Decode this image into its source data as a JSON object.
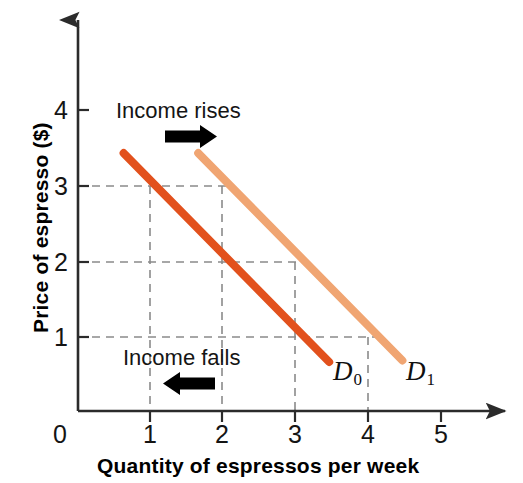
{
  "chart_data": {
    "type": "line",
    "title": "",
    "xlabel": "Quantity of espressos per week",
    "ylabel": "Price of espresso ($)",
    "xlim": [
      0,
      5.8
    ],
    "ylim": [
      0,
      4.6
    ],
    "xticks": [
      "0",
      "1",
      "2",
      "3",
      "4",
      "5"
    ],
    "xtick_values": [
      0,
      1,
      2,
      3,
      4,
      5
    ],
    "yticks": [
      "1",
      "2",
      "3",
      "4"
    ],
    "ytick_values": [
      1,
      2,
      3,
      4
    ],
    "grid": "dashed-guides",
    "legend": "inline-curve-labels",
    "series": [
      {
        "name": "D0",
        "label": "D",
        "subscript": "0",
        "color": "#e2511d",
        "points": [
          [
            0.63,
            3.42
          ],
          [
            3.47,
            0.65
          ]
        ],
        "reference_points": [
          [
            1,
            3
          ],
          [
            2,
            2
          ],
          [
            3,
            1
          ]
        ]
      },
      {
        "name": "D1",
        "label": "D",
        "subscript": "1",
        "color": "#f0a572",
        "points": [
          [
            1.66,
            3.42
          ],
          [
            4.48,
            0.67
          ]
        ],
        "reference_points": [
          [
            2,
            3
          ],
          [
            3,
            2
          ],
          [
            4,
            1
          ]
        ]
      }
    ],
    "guides": {
      "horizontal": [
        {
          "price": 3,
          "extends_to_quantity": 2.1
        },
        {
          "price": 2,
          "extends_to_quantity": 3.1
        },
        {
          "price": 1,
          "extends_to_quantity": 4.1
        }
      ],
      "vertical": [
        {
          "quantity": 1,
          "extends_to_price": 3
        },
        {
          "quantity": 2,
          "extends_to_price": 3
        },
        {
          "quantity": 3,
          "extends_to_price": 2
        },
        {
          "quantity": 4,
          "extends_to_price": 1
        }
      ]
    },
    "annotations": [
      {
        "name": "income-rises",
        "text": "Income rises",
        "arrow": "right",
        "x": 1.5,
        "y": 3.95
      },
      {
        "name": "income-falls",
        "text": "Income falls",
        "arrow": "left",
        "x": 1.5,
        "y": 0.75
      }
    ]
  },
  "axes": {
    "x_title": "Quantity of espressos per week",
    "y_title": "Price of espresso ($)",
    "origin_label": "0",
    "x_tick_labels": [
      "1",
      "2",
      "3",
      "4",
      "5"
    ],
    "y_tick_labels": [
      "4",
      "3",
      "2",
      "1"
    ]
  },
  "annotations": {
    "income_rises": "Income rises",
    "income_falls": "Income falls"
  },
  "curves": {
    "d0": {
      "label": "D",
      "subscript": "0"
    },
    "d1": {
      "label": "D",
      "subscript": "1"
    }
  },
  "colors": {
    "d0": "#e2511d",
    "d1": "#f0a572",
    "axis": "#2b2b2b",
    "grid": "#8f8f8f",
    "arrow": "#000000",
    "background": "#ffffff"
  }
}
